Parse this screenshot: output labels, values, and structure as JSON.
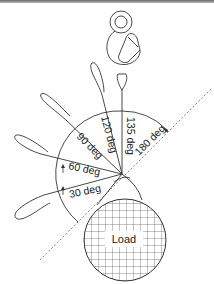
{
  "diagram": {
    "angle_labels": [
      "30 deg",
      "60 deg",
      "90 deg",
      "120 deg",
      "135 deg",
      "180 deg"
    ],
    "load_label": "Load",
    "colors": {
      "line": "#333333",
      "grid": "#555555",
      "dashed": "#666666",
      "background": "#ffffff"
    }
  }
}
